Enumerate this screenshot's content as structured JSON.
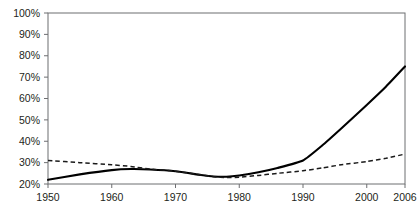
{
  "chart_data": {
    "type": "line",
    "title": "",
    "subtitle": "",
    "xlabel": "",
    "ylabel": "",
    "xlim": [
      1950,
      2006
    ],
    "ylim": [
      20,
      100
    ],
    "grid": false,
    "legend": "none",
    "y_ticks": [
      "20%",
      "30%",
      "40%",
      "50%",
      "60%",
      "70%",
      "80%",
      "90%",
      "100%"
    ],
    "y_tick_values": [
      20,
      30,
      40,
      50,
      60,
      70,
      80,
      90,
      100
    ],
    "x_ticks": [
      "1950",
      "1960",
      "1970",
      "1980",
      "1990",
      "2000",
      "2006"
    ],
    "x_tick_values": [
      1950,
      1960,
      1970,
      1980,
      1990,
      2000,
      2006
    ],
    "series": [
      {
        "name": "solid-series",
        "style": "solid",
        "color": "#000000",
        "x": [
          1950,
          1955,
          1960,
          1963,
          1966,
          1970,
          1974,
          1976,
          1978,
          1980,
          1983,
          1986,
          1990,
          1993,
          1996,
          2000,
          2003,
          2006
        ],
        "values": [
          22,
          24.5,
          26.5,
          27,
          26.8,
          26,
          24.2,
          23.5,
          23.4,
          24,
          25.5,
          27.5,
          31,
          38,
          46,
          57,
          65.5,
          75
        ]
      },
      {
        "name": "dashed-series",
        "style": "dashed",
        "color": "#1a1a1a",
        "x": [
          1950,
          1955,
          1960,
          1963,
          1966,
          1970,
          1974,
          1976,
          1978,
          1980,
          1983,
          1986,
          1990,
          1993,
          1996,
          2000,
          2003,
          2006
        ],
        "values": [
          31,
          30,
          29,
          28.2,
          27,
          26,
          24.2,
          23.4,
          23,
          23.2,
          24,
          25,
          26.2,
          27.5,
          29,
          30.5,
          32,
          34
        ]
      }
    ]
  },
  "layout": {
    "plot_left": 48,
    "plot_right": 405,
    "plot_top": 13,
    "plot_bottom": 184
  }
}
